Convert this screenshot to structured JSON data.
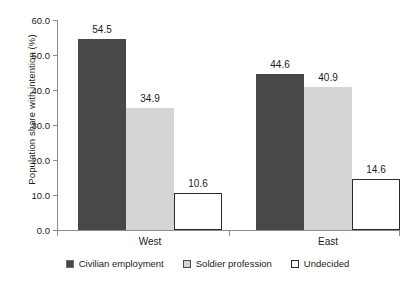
{
  "chart_data": {
    "type": "bar",
    "title": "",
    "xlabel": "",
    "ylabel": "Population share with intention (%)",
    "categories": [
      "West",
      "East"
    ],
    "series": [
      {
        "name": "Civilian employment",
        "color": "#484848",
        "values": [
          54.5,
          44.6
        ]
      },
      {
        "name": "Soldier profession",
        "color": "#d5d5d5",
        "values": [
          34.9,
          40.9
        ]
      },
      {
        "name": "Undecided",
        "color": "#ffffff",
        "values": [
          10.6,
          14.6
        ]
      }
    ],
    "ylim": [
      0.0,
      60.0
    ],
    "ytick_step": 10.0,
    "yticks": [
      "0.0",
      "10.0",
      "20.0",
      "30.0",
      "40.0",
      "50.0",
      "60.0"
    ],
    "grid": false,
    "legend_position": "bottom",
    "data_labels": [
      "54.5",
      "34.9",
      "10.6",
      "44.6",
      "40.9",
      "14.6"
    ]
  }
}
